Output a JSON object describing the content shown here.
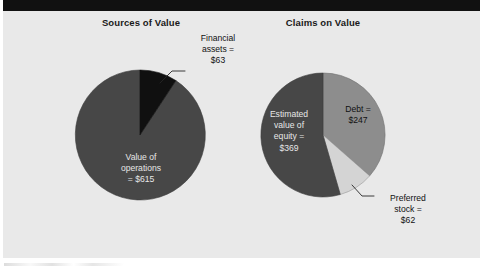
{
  "figure": {
    "background_color": "#e9e9e9",
    "banner_color": "#111111"
  },
  "panels": [
    {
      "title": "Sources of Value"
    },
    {
      "title": "Claims on Value"
    }
  ],
  "labels": {
    "financial_assets": "Financial\nassets =\n$63",
    "value_of_operations": "Value of\noperations\n= $615",
    "estimated_value_of_equity": "Estimated\nvalue of\nequity =\n$369",
    "debt": "Debt =\n$247",
    "preferred_stock": "Preferred\nstock =\n$62"
  },
  "chart_data": [
    {
      "type": "pie",
      "title": "Sources of Value",
      "categories": [
        "Value of operations",
        "Financial assets"
      ],
      "values": [
        615,
        63
      ],
      "total": 678,
      "value_prefix": "$",
      "percentages": [
        90.7,
        9.3
      ],
      "start_angle_deg": 0,
      "direction": "clockwise",
      "colors": [
        "#474747",
        "#101010"
      ],
      "label_texts": [
        "Value of operations = $615",
        "Financial assets = $63"
      ],
      "label_placement": [
        "inside",
        "outside-leader"
      ],
      "legend": "none",
      "grid": false
    },
    {
      "type": "pie",
      "title": "Claims on Value",
      "categories": [
        "Debt",
        "Preferred stock",
        "Estimated value of equity"
      ],
      "values": [
        247,
        62,
        369
      ],
      "total": 678,
      "value_prefix": "$",
      "percentages": [
        36.4,
        9.1,
        54.4
      ],
      "start_angle_deg": 0,
      "direction": "clockwise",
      "colors": [
        "#8d8d8d",
        "#d4d4d4",
        "#474747"
      ],
      "label_texts": [
        "Debt = $247",
        "Preferred stock = $62",
        "Estimated value of equity = $369"
      ],
      "label_placement": [
        "inside",
        "outside-leader",
        "inside"
      ],
      "legend": "none",
      "grid": false
    }
  ]
}
